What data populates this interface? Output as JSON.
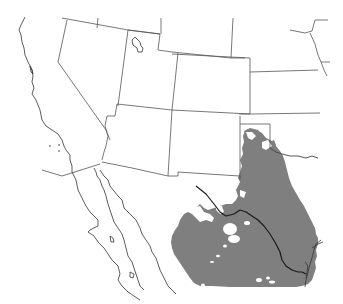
{
  "map": {
    "region": "Southwestern United States and Northern Mexico",
    "background_color": "#ffffff",
    "border_color": "#555555",
    "range_color": "#7f7f7f",
    "river_color": "#1a1a1a",
    "layers": [
      {
        "name": "state-borders",
        "type": "line"
      },
      {
        "name": "coastline",
        "type": "line"
      },
      {
        "name": "species-range",
        "type": "filled-area",
        "color": "#7f7f7f"
      },
      {
        "name": "rio-grande-river",
        "type": "line"
      },
      {
        "name": "great-salt-lake",
        "type": "outline"
      }
    ]
  }
}
